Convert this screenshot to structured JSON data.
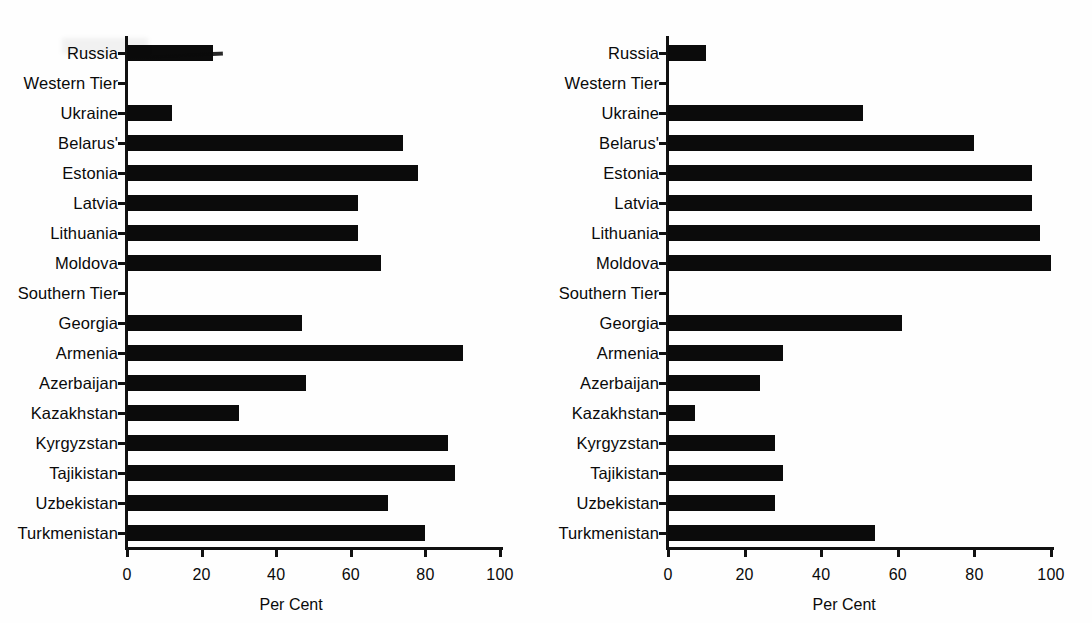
{
  "figure": {
    "axis_title": "Per Cent",
    "categories": [
      "Russia",
      "Western Tier",
      "Ukraine",
      "Belarus'",
      "Estonia",
      "Latvia",
      "Lithuania",
      "Moldova",
      "Southern Tier",
      "Georgia",
      "Armenia",
      "Azerbaijan",
      "Kazakhstan",
      "Kyrgyzstan",
      "Tajikistan",
      "Uzbekistan",
      "Turkmenistan"
    ],
    "xticks": [
      "0",
      "20",
      "40",
      "60",
      "80",
      "100"
    ]
  },
  "chart_data": [
    {
      "type": "bar",
      "orientation": "horizontal",
      "panel": "left",
      "title": "",
      "xlabel": "Per Cent",
      "ylabel": "",
      "xlim": [
        0,
        100
      ],
      "xticks": [
        0,
        20,
        40,
        60,
        80,
        100
      ],
      "grid": false,
      "legend": "none",
      "bar_color": "#0b0b0b",
      "categories": [
        "Russia",
        "Western Tier",
        "Ukraine",
        "Belarus'",
        "Estonia",
        "Latvia",
        "Lithuania",
        "Moldova",
        "Southern Tier",
        "Georgia",
        "Armenia",
        "Azerbaijan",
        "Kazakhstan",
        "Kyrgyzstan",
        "Tajikistan",
        "Uzbekistan",
        "Turkmenistan"
      ],
      "values": [
        23,
        0,
        12,
        74,
        78,
        62,
        62,
        68,
        0,
        47,
        90,
        48,
        30,
        86,
        88,
        70,
        80
      ]
    },
    {
      "type": "bar",
      "orientation": "horizontal",
      "panel": "right",
      "title": "",
      "xlabel": "Per Cent",
      "ylabel": "",
      "xlim": [
        0,
        100
      ],
      "xticks": [
        0,
        20,
        40,
        60,
        80,
        100
      ],
      "grid": false,
      "legend": "none",
      "bar_color": "#0b0b0b",
      "categories": [
        "Russia",
        "Western Tier",
        "Ukraine",
        "Belarus'",
        "Estonia",
        "Latvia",
        "Lithuania",
        "Moldova",
        "Southern Tier",
        "Georgia",
        "Armenia",
        "Azerbaijan",
        "Kazakhstan",
        "Kyrgyzstan",
        "Tajikistan",
        "Uzbekistan",
        "Turkmenistan"
      ],
      "values": [
        10,
        0,
        51,
        80,
        95,
        95,
        97,
        100,
        0,
        61,
        30,
        24,
        7,
        28,
        30,
        28,
        54
      ]
    }
  ]
}
